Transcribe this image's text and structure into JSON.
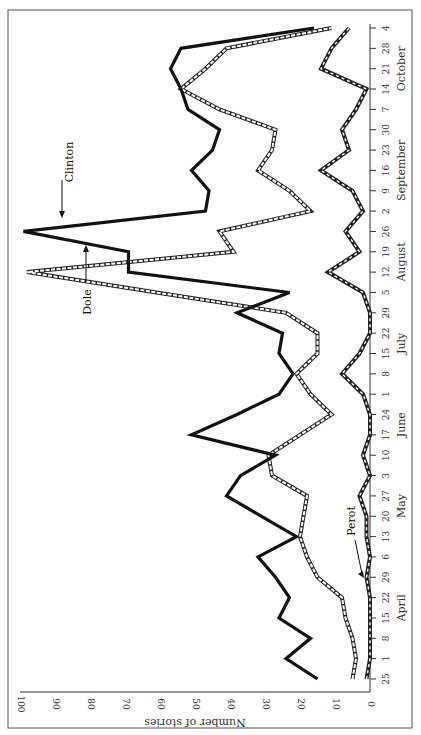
{
  "chart_data": {
    "type": "line",
    "orientation": "rotated-90-clockwise",
    "title": "",
    "xlabel": "",
    "ylabel": "Number of stories",
    "ylim": [
      0,
      100
    ],
    "yticks": [
      "0",
      "10",
      "20",
      "30",
      "40",
      "50",
      "60",
      "70",
      "80",
      "90",
      "100"
    ],
    "x": [
      "25",
      "1",
      "8",
      "15",
      "22",
      "29",
      "6",
      "13",
      "20",
      "27",
      "3",
      "10",
      "17",
      "24",
      "1",
      "8",
      "15",
      "22",
      "29",
      "5",
      "12",
      "19",
      "26",
      "2",
      "9",
      "16",
      "23",
      "30",
      "7",
      "14",
      "21",
      "28",
      "4"
    ],
    "months": [
      {
        "label": "April",
        "at_index": 3.5
      },
      {
        "label": "May",
        "at_index": 8.5
      },
      {
        "label": "June",
        "at_index": 12.5
      },
      {
        "label": "July",
        "at_index": 16.5
      },
      {
        "label": "August",
        "at_index": 20.5
      },
      {
        "label": "September",
        "at_index": 25
      },
      {
        "label": "October",
        "at_index": 30
      }
    ],
    "grid": false,
    "series": [
      {
        "name": "Clinton",
        "style": "solid-thick",
        "values": [
          15,
          24,
          17,
          26,
          23,
          27,
          32,
          21,
          31,
          41,
          37,
          27,
          51,
          38,
          26,
          22,
          26,
          25,
          38,
          23,
          69,
          69,
          99,
          47,
          46,
          51,
          45,
          43,
          52,
          54,
          57,
          54,
          16
        ]
      },
      {
        "name": "Dole",
        "style": "hollow-dashed-wide",
        "values": [
          5,
          4,
          5,
          7,
          8,
          15,
          18,
          20,
          19,
          18,
          28,
          29,
          20,
          11,
          17,
          21,
          15,
          15,
          24,
          61,
          98,
          39,
          43,
          17,
          23,
          32,
          28,
          27,
          43,
          54,
          47,
          41,
          11
        ]
      },
      {
        "name": "Perot",
        "style": "hollow-dashed-narrow",
        "values": [
          1,
          0,
          0,
          0,
          0,
          1,
          0,
          1,
          1,
          3,
          0,
          2,
          0,
          0,
          2,
          8,
          3,
          0,
          0,
          2,
          12,
          3,
          7,
          2,
          5,
          14,
          6,
          8,
          4,
          1,
          14,
          11,
          6
        ]
      }
    ],
    "annotations": [
      {
        "label": "Clinton",
        "series": "Clinton",
        "at_index": 23.5
      },
      {
        "label": "Dole",
        "series": "Dole",
        "at_index": 19.5
      },
      {
        "label": "Perot",
        "series": "Perot",
        "at_index": 5
      }
    ],
    "legend": "none (inline annotations)"
  }
}
